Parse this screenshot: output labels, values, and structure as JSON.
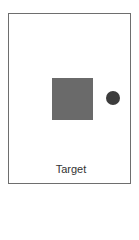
{
  "figure": {
    "label": "Target",
    "shapes": [
      {
        "type": "square",
        "color": "#6a6a6a"
      },
      {
        "type": "circle",
        "color": "#3c3c3c"
      }
    ],
    "frame_color": "#6e6e6e",
    "background": "#ffffff"
  }
}
